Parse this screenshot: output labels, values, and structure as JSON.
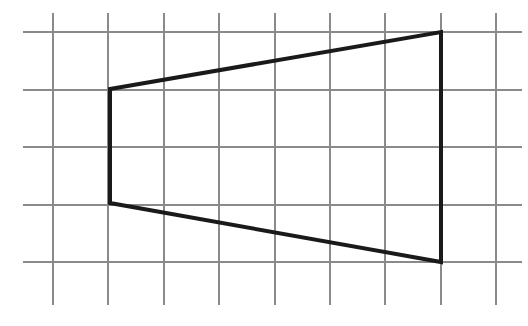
{
  "figure": {
    "type": "geometry-figure",
    "width": 528,
    "height": 326,
    "background_color": "#ffffff"
  },
  "grid": {
    "line_color": "#8a8a8a",
    "line_width": 2,
    "cell_width": 55.4,
    "cell_height": 57.5,
    "vertical_lines_x": [
      53,
      108.4,
      163.8,
      219.2,
      274.6,
      330,
      385.4,
      440.8,
      496.2
    ],
    "horizontal_lines_y": [
      32,
      89.5,
      147,
      204.5,
      262
    ],
    "vertical_span_y": [
      13,
      305
    ],
    "horizontal_span_x": [
      23,
      522
    ]
  },
  "shape": {
    "name": "quadrilateral",
    "stroke_color": "#1a1a1a",
    "stroke_width": 4,
    "fill": "none",
    "closed": true,
    "vertex_count": 4,
    "vertices": [
      {
        "label": "top-left",
        "x": 110,
        "y": 89,
        "grid_col": 1,
        "grid_row": 1
      },
      {
        "label": "top-right",
        "x": 441,
        "y": 32,
        "grid_col": 7,
        "grid_row": 0
      },
      {
        "label": "bottom-right",
        "x": 441,
        "y": 262,
        "grid_col": 7,
        "grid_row": 4
      },
      {
        "label": "bottom-left",
        "x": 110,
        "y": 203,
        "grid_col": 1,
        "grid_row": 3
      }
    ],
    "edges": [
      {
        "label": "top-edge",
        "from": "top-left",
        "to": "top-right"
      },
      {
        "label": "right-edge",
        "from": "top-right",
        "to": "bottom-right"
      },
      {
        "label": "bottom-edge",
        "from": "bottom-right",
        "to": "bottom-left"
      },
      {
        "label": "left-edge",
        "from": "bottom-left",
        "to": "top-left"
      }
    ],
    "points_attribute": "110,89 441,32 441,262 110,203"
  }
}
